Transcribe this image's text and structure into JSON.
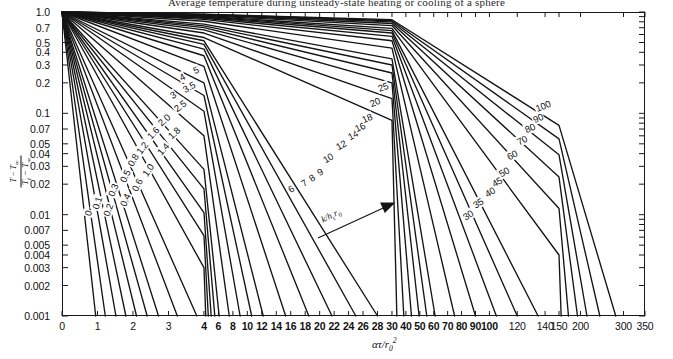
{
  "caption": {
    "text": "Average temperature during unsteady-state heating or cooling of a sphere"
  },
  "axes": {
    "x_title_plain": "ατ/r0²",
    "y_title_plain": "(T - T∞)/(Ti - T∞)",
    "x_scale": "piecewise-linear (compressed)",
    "y_scale": "log",
    "y_min": 0.001,
    "y_max": 1.0,
    "x_min": 0,
    "x_max": 350,
    "grid": false
  },
  "annotation": {
    "parameter_label": "k/hc r0",
    "arrow": "increasing-parameter-arrow"
  },
  "chart_data": {
    "type": "line",
    "title": "Average temperature during unsteady-state heating or cooling of a sphere",
    "xlabel": "ατ/r0²",
    "ylabel": "(T - T∞)/(Ti - T∞)",
    "xscale": "piecewise-linear",
    "yscale": "log",
    "xlim": [
      0,
      350
    ],
    "ylim": [
      0.001,
      1.0
    ],
    "grid": false,
    "legend_position": "inline-curve-labels",
    "x_ticks": [
      0,
      1,
      2,
      3,
      4,
      6,
      8,
      10,
      12,
      14,
      16,
      18,
      20,
      22,
      24,
      26,
      28,
      30,
      40,
      50,
      60,
      70,
      80,
      90,
      100,
      120,
      140,
      150,
      200,
      300,
      350
    ],
    "x_tick_labels": [
      "0",
      "1",
      "2",
      "3",
      "4",
      "6",
      "8",
      "10",
      "12",
      "14",
      "16",
      "18",
      "20",
      "22",
      "24",
      "26",
      "28",
      "30",
      "40",
      "50",
      "60",
      "70",
      "80",
      "90",
      "100",
      "120",
      "140",
      "150",
      "200",
      "300",
      "350"
    ],
    "y_ticks": [
      1.0,
      0.7,
      0.5,
      0.4,
      0.3,
      0.2,
      0.1,
      0.07,
      0.05,
      0.04,
      0.03,
      0.02,
      0.01,
      0.007,
      0.005,
      0.004,
      0.003,
      0.002,
      0.001
    ],
    "y_tick_labels": [
      "1.0",
      "0.7",
      "0.5",
      "0.4",
      "0.3",
      "0.2",
      "0.1",
      "0.07",
      "0.05",
      "0.04",
      "0.03",
      "0.02",
      "0.01",
      "0.007",
      "0.005",
      "0.004",
      "0.003",
      "0.002",
      "0.001"
    ],
    "series_parameter_name": "k/hc r0",
    "series": [
      {
        "name": "0",
        "label": "0",
        "x": [
          0,
          0.95
        ],
        "y": [
          1.0,
          0.001
        ]
      },
      {
        "name": "0.1",
        "label": "0.1",
        "x": [
          0,
          1.22
        ],
        "y": [
          1.0,
          0.001
        ]
      },
      {
        "name": "0.2",
        "label": "0.2",
        "x": [
          0,
          1.52
        ],
        "y": [
          1.0,
          0.001
        ]
      },
      {
        "name": "0.3",
        "label": "0.3",
        "x": [
          0,
          1.8
        ],
        "y": [
          1.0,
          0.001
        ]
      },
      {
        "name": "0.4",
        "label": "0.4",
        "x": [
          0,
          2.1
        ],
        "y": [
          1.0,
          0.001
        ]
      },
      {
        "name": "0.5",
        "label": "0.5",
        "x": [
          0,
          2.4
        ],
        "y": [
          1.0,
          0.001
        ]
      },
      {
        "name": "0.6",
        "label": "0.6",
        "x": [
          0,
          2.72
        ],
        "y": [
          1.0,
          0.001
        ]
      },
      {
        "name": "0.8",
        "label": "0.8",
        "x": [
          0,
          3.25
        ],
        "y": [
          1.0,
          0.001
        ]
      },
      {
        "name": "1.0",
        "label": "1.0",
        "x": [
          0,
          3.8
        ],
        "y": [
          1.0,
          0.001
        ]
      },
      {
        "name": "1.2",
        "label": "1.2",
        "x": [
          0,
          4.0,
          4.25
        ],
        "y": [
          1.0,
          0.003,
          0.001
        ]
      },
      {
        "name": "1.4",
        "label": "1.4",
        "x": [
          0,
          4.0,
          4.6
        ],
        "y": [
          1.0,
          0.0062,
          0.001
        ]
      },
      {
        "name": "1.6",
        "label": "1.6",
        "x": [
          0,
          4.0,
          5.0
        ],
        "y": [
          1.0,
          0.0105,
          0.001
        ]
      },
      {
        "name": "1.8",
        "label": "1.8",
        "x": [
          0,
          4.0,
          5.5
        ],
        "y": [
          1.0,
          0.018,
          0.001
        ]
      },
      {
        "name": "2.0",
        "label": "2.0",
        "x": [
          0,
          4.0,
          6.1
        ],
        "y": [
          1.0,
          0.028,
          0.001
        ]
      },
      {
        "name": "2.5",
        "label": "2.5",
        "x": [
          0,
          4.0,
          7.5
        ],
        "y": [
          1.0,
          0.06,
          0.001
        ]
      },
      {
        "name": "3",
        "label": "3",
        "x": [
          0,
          4.0,
          9.0
        ],
        "y": [
          1.0,
          0.105,
          0.001
        ]
      },
      {
        "name": "3.5",
        "label": "3.5",
        "x": [
          0,
          4.0,
          10.6
        ],
        "y": [
          1.0,
          0.15,
          0.001
        ]
      },
      {
        "name": "4",
        "label": "4",
        "x": [
          0,
          4.0,
          12.2
        ],
        "y": [
          1.0,
          0.2,
          0.001
        ]
      },
      {
        "name": "5",
        "label": "5",
        "x": [
          0,
          4.0,
          15.3
        ],
        "y": [
          1.0,
          0.29,
          0.001
        ]
      },
      {
        "name": "6",
        "label": "6",
        "x": [
          0,
          4.0,
          18.5
        ],
        "y": [
          1.0,
          0.37,
          0.001
        ]
      },
      {
        "name": "7",
        "label": "7",
        "x": [
          0,
          4.0,
          21.7
        ],
        "y": [
          1.0,
          0.43,
          0.001
        ]
      },
      {
        "name": "8",
        "label": "8",
        "x": [
          0,
          4.0,
          25.0
        ],
        "y": [
          1.0,
          0.48,
          0.001
        ]
      },
      {
        "name": "9",
        "label": "9",
        "x": [
          0,
          4.0,
          28.0
        ],
        "y": [
          1.0,
          0.52,
          0.001
        ]
      },
      {
        "name": "10",
        "label": "10",
        "x": [
          0,
          4.0,
          30.0,
          33.5
        ],
        "y": [
          1.0,
          0.56,
          0.085,
          0.001
        ]
      },
      {
        "name": "12",
        "label": "12",
        "x": [
          0,
          4.0,
          30.0,
          38.5
        ],
        "y": [
          1.0,
          0.62,
          0.14,
          0.001
        ]
      },
      {
        "name": "14",
        "label": "14",
        "x": [
          0,
          4.0,
          30.0,
          44.0
        ],
        "y": [
          1.0,
          0.665,
          0.2,
          0.001
        ]
      },
      {
        "name": "16",
        "label": "16",
        "x": [
          0,
          4.0,
          30.0,
          49.5
        ],
        "y": [
          1.0,
          0.7,
          0.25,
          0.001
        ]
      },
      {
        "name": "18",
        "label": "18",
        "x": [
          0,
          4.0,
          30.0,
          55.0
        ],
        "y": [
          1.0,
          0.73,
          0.3,
          0.001
        ]
      },
      {
        "name": "20",
        "label": "20",
        "x": [
          0,
          4.0,
          30.0,
          61.0
        ],
        "y": [
          1.0,
          0.76,
          0.345,
          0.001
        ]
      },
      {
        "name": "25",
        "label": "25",
        "x": [
          0,
          4.0,
          30.0,
          75.0
        ],
        "y": [
          1.0,
          0.81,
          0.44,
          0.001
        ]
      },
      {
        "name": "30",
        "label": "30",
        "x": [
          0,
          4.0,
          30.0,
          90.0
        ],
        "y": [
          1.0,
          0.845,
          0.52,
          0.001
        ]
      },
      {
        "name": "35",
        "label": "35",
        "x": [
          0,
          4.0,
          30.0,
          105.0
        ],
        "y": [
          1.0,
          0.868,
          0.575,
          0.001
        ]
      },
      {
        "name": "40",
        "label": "40",
        "x": [
          0,
          4.0,
          30.0,
          120.0
        ],
        "y": [
          1.0,
          0.885,
          0.62,
          0.001
        ]
      },
      {
        "name": "45",
        "label": "45",
        "x": [
          0,
          4.0,
          30.0,
          135.0
        ],
        "y": [
          1.0,
          0.898,
          0.655,
          0.001
        ]
      },
      {
        "name": "50",
        "label": "50",
        "x": [
          0,
          4.0,
          30.0,
          150.0,
          155.0
        ],
        "y": [
          1.0,
          0.908,
          0.69,
          0.004,
          0.001
        ]
      },
      {
        "name": "60",
        "label": "60",
        "x": [
          0,
          4.0,
          30.0,
          150.0,
          172.0
        ],
        "y": [
          1.0,
          0.923,
          0.735,
          0.0115,
          0.001
        ]
      },
      {
        "name": "70",
        "label": "70",
        "x": [
          0,
          4.0,
          30.0,
          150.0,
          193.0
        ],
        "y": [
          1.0,
          0.933,
          0.77,
          0.0235,
          0.001
        ]
      },
      {
        "name": "80",
        "label": "80",
        "x": [
          0,
          4.0,
          30.0,
          150.0,
          215.0
        ],
        "y": [
          1.0,
          0.941,
          0.798,
          0.039,
          0.001
        ]
      },
      {
        "name": "90",
        "label": "90",
        "x": [
          0,
          4.0,
          30.0,
          150.0,
          245.0
        ],
        "y": [
          1.0,
          0.948,
          0.82,
          0.056,
          0.001
        ]
      },
      {
        "name": "100",
        "label": "100",
        "x": [
          0,
          4.0,
          30.0,
          150.0,
          282.0
        ],
        "y": [
          1.0,
          0.953,
          0.838,
          0.076,
          0.001
        ]
      }
    ]
  },
  "curve_labels": [
    {
      "text": "0",
      "x": 88,
      "y": 213,
      "rot": -74
    },
    {
      "text": "0.1",
      "x": 97,
      "y": 203,
      "rot": -72
    },
    {
      "text": "0.2",
      "x": 108,
      "y": 210,
      "rot": -70
    },
    {
      "text": "0.3",
      "x": 113,
      "y": 190,
      "rot": -68
    },
    {
      "text": "0.4",
      "x": 125,
      "y": 200,
      "rot": -66
    },
    {
      "text": "0.5",
      "x": 125,
      "y": 176,
      "rot": -64
    },
    {
      "text": "0.6",
      "x": 137,
      "y": 185,
      "rot": -62
    },
    {
      "text": "0.8",
      "x": 133,
      "y": 160,
      "rot": -58
    },
    {
      "text": "1.0",
      "x": 148,
      "y": 170,
      "rot": -55
    },
    {
      "text": "1.2",
      "x": 142,
      "y": 148,
      "rot": -52
    },
    {
      "text": "1.4",
      "x": 163,
      "y": 149,
      "rot": -49
    },
    {
      "text": "1.6",
      "x": 153,
      "y": 133,
      "rot": -47
    },
    {
      "text": "1.8",
      "x": 174,
      "y": 133,
      "rot": -43
    },
    {
      "text": "2.0",
      "x": 164,
      "y": 120,
      "rot": -41
    },
    {
      "text": "2.5",
      "x": 180,
      "y": 106,
      "rot": -36
    },
    {
      "text": "3",
      "x": 173,
      "y": 95,
      "rot": -33
    },
    {
      "text": "3.5",
      "x": 189,
      "y": 87,
      "rot": -30
    },
    {
      "text": "4",
      "x": 182,
      "y": 77,
      "rot": -28
    },
    {
      "text": "5",
      "x": 196,
      "y": 70,
      "rot": -24
    },
    {
      "text": "6",
      "x": 291,
      "y": 189,
      "rot": -36
    },
    {
      "text": "7",
      "x": 304,
      "y": 183,
      "rot": -35
    },
    {
      "text": "8",
      "x": 312,
      "y": 178,
      "rot": -34
    },
    {
      "text": "9",
      "x": 320,
      "y": 172,
      "rot": -33
    },
    {
      "text": "10",
      "x": 328,
      "y": 158,
      "rot": -31
    },
    {
      "text": "12",
      "x": 341,
      "y": 145,
      "rot": -29
    },
    {
      "text": "14",
      "x": 353,
      "y": 135,
      "rot": -27
    },
    {
      "text": "16",
      "x": 360,
      "y": 127,
      "rot": -25
    },
    {
      "text": "18",
      "x": 367,
      "y": 118,
      "rot": -24
    },
    {
      "text": "20",
      "x": 375,
      "y": 102,
      "rot": -22
    },
    {
      "text": "25",
      "x": 383,
      "y": 87,
      "rot": -20
    },
    {
      "text": "30",
      "x": 468,
      "y": 215,
      "rot": -34
    },
    {
      "text": "35",
      "x": 478,
      "y": 203,
      "rot": -33
    },
    {
      "text": "40",
      "x": 490,
      "y": 192,
      "rot": -32
    },
    {
      "text": "45",
      "x": 497,
      "y": 182,
      "rot": -31
    },
    {
      "text": "50",
      "x": 504,
      "y": 172,
      "rot": -30
    },
    {
      "text": "60",
      "x": 512,
      "y": 155,
      "rot": -28
    },
    {
      "text": "70",
      "x": 522,
      "y": 140,
      "rot": -26
    },
    {
      "text": "80",
      "x": 530,
      "y": 128,
      "rot": -25
    },
    {
      "text": "90",
      "x": 538,
      "y": 118,
      "rot": -24
    },
    {
      "text": "100",
      "x": 543,
      "y": 106,
      "rot": -22
    }
  ]
}
